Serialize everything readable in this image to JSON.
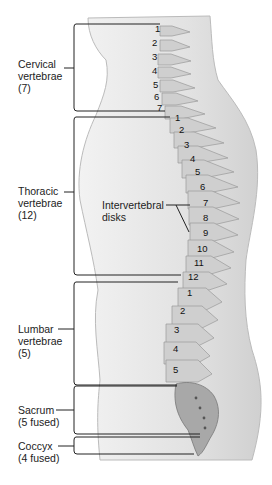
{
  "diagram": {
    "regions": [
      {
        "id": "cervical",
        "lines": [
          "Cervical",
          "vertebrae",
          "(7)"
        ],
        "count": 7,
        "numbers": [
          "1",
          "2",
          "3",
          "4",
          "5",
          "6",
          "7"
        ]
      },
      {
        "id": "thoracic",
        "lines": [
          "Thoracic",
          "vertebrae",
          "(12)"
        ],
        "count": 12,
        "numbers": [
          "1",
          "2",
          "3",
          "4",
          "5",
          "6",
          "7",
          "8",
          "9",
          "10",
          "11",
          "12"
        ]
      },
      {
        "id": "lumbar",
        "lines": [
          "Lumbar",
          "vertebrae",
          "(5)"
        ],
        "count": 5,
        "numbers": [
          "1",
          "2",
          "3",
          "4",
          "5"
        ]
      },
      {
        "id": "sacrum",
        "lines": [
          "Sacrum",
          "(5 fused)"
        ]
      },
      {
        "id": "coccyx",
        "lines": [
          "Coccyx",
          "(4 fused)"
        ]
      }
    ],
    "callout": {
      "lines": [
        "Intervertebral",
        "disks"
      ]
    },
    "colors": {
      "body": "#e4e4e4",
      "bone": "#c8c8c8",
      "bone_dark": "#8a8a8a",
      "line": "#222222"
    }
  }
}
